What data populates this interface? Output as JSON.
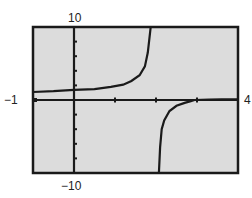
{
  "chart_data": {
    "type": "line",
    "title": "",
    "xlabel": "",
    "ylabel": "",
    "xlim": [
      -1,
      4
    ],
    "ylim": [
      -10,
      10
    ],
    "grid": false,
    "legend": null,
    "window_labels": {
      "xmin": "−1",
      "xmax": "4",
      "ymin": "−10",
      "ymax": "10"
    },
    "x_ticks": [
      1,
      2,
      3
    ],
    "y_ticks": [
      -8,
      -6,
      -4,
      -2,
      2,
      4,
      6,
      8
    ],
    "vertical_asymptote": 2,
    "series": [
      {
        "name": "left-branch",
        "x": [
          -1.0,
          -0.5,
          0.0,
          0.5,
          0.9,
          1.2,
          1.4,
          1.6,
          1.73,
          1.8,
          1.87
        ],
        "y": [
          1.1,
          1.2,
          1.4,
          1.5,
          1.8,
          2.1,
          2.6,
          3.4,
          4.6,
          6.5,
          10
        ]
      },
      {
        "name": "right-branch",
        "x": [
          2.07,
          2.1,
          2.14,
          2.2,
          2.33,
          2.5,
          2.7,
          2.85,
          2.94,
          3.3,
          3.6,
          4.0
        ],
        "y": [
          -10,
          -6.5,
          -4,
          -2.8,
          -1.5,
          -0.8,
          -0.4,
          -0.15,
          0,
          0.05,
          0.1,
          0.1
        ]
      }
    ],
    "colors": {
      "screen": "#dcdcdc",
      "frame": "#1a1a1a",
      "curve": "#1a1a1a",
      "axes": "#1a1a1a"
    }
  },
  "labels": {
    "xmin": "−1",
    "xmax": "4",
    "ymin": "−10",
    "ymax": "10"
  }
}
